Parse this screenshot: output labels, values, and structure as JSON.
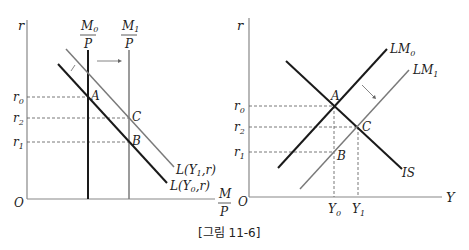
{
  "caption": "[그림 11-6]",
  "left_panel": {
    "title": "Money market",
    "y_axis_label": "r",
    "x_axis_label_num": "M",
    "x_axis_label_den": "P",
    "origin": "O",
    "supply0_num": "M",
    "supply0_sub": "0",
    "supply0_den": "P",
    "supply1_num": "M",
    "supply1_sub": "1",
    "supply1_den": "P",
    "demand0_label": "L(Y",
    "demand0_sub": "0",
    "demand0_tail": ",r)",
    "demand1_label": "L(Y",
    "demand1_sub": "1",
    "demand1_tail": ",r)",
    "rate_labels": [
      {
        "base": "r",
        "sub": "0"
      },
      {
        "base": "r",
        "sub": "2"
      },
      {
        "base": "r",
        "sub": "1"
      }
    ],
    "points": [
      "A",
      "C",
      "B"
    ]
  },
  "right_panel": {
    "title": "IS-LM",
    "y_axis_label": "r",
    "x_axis_label": "Y",
    "origin": "O",
    "lm0_label": "LM",
    "lm0_sub": "0",
    "lm1_label": "LM",
    "lm1_sub": "1",
    "is_label": "IS",
    "rate_labels": [
      {
        "base": "r",
        "sub": "0"
      },
      {
        "base": "r",
        "sub": "2"
      },
      {
        "base": "r",
        "sub": "1"
      }
    ],
    "output_labels": [
      {
        "base": "Y",
        "sub": "0"
      },
      {
        "base": "Y",
        "sub": "1"
      }
    ],
    "points": [
      "A",
      "C",
      "B"
    ]
  },
  "colors": {
    "black_line": "#1a1a1a",
    "grey_line": "#7a7a7a",
    "axis": "#888888",
    "dashed": "#555555"
  }
}
